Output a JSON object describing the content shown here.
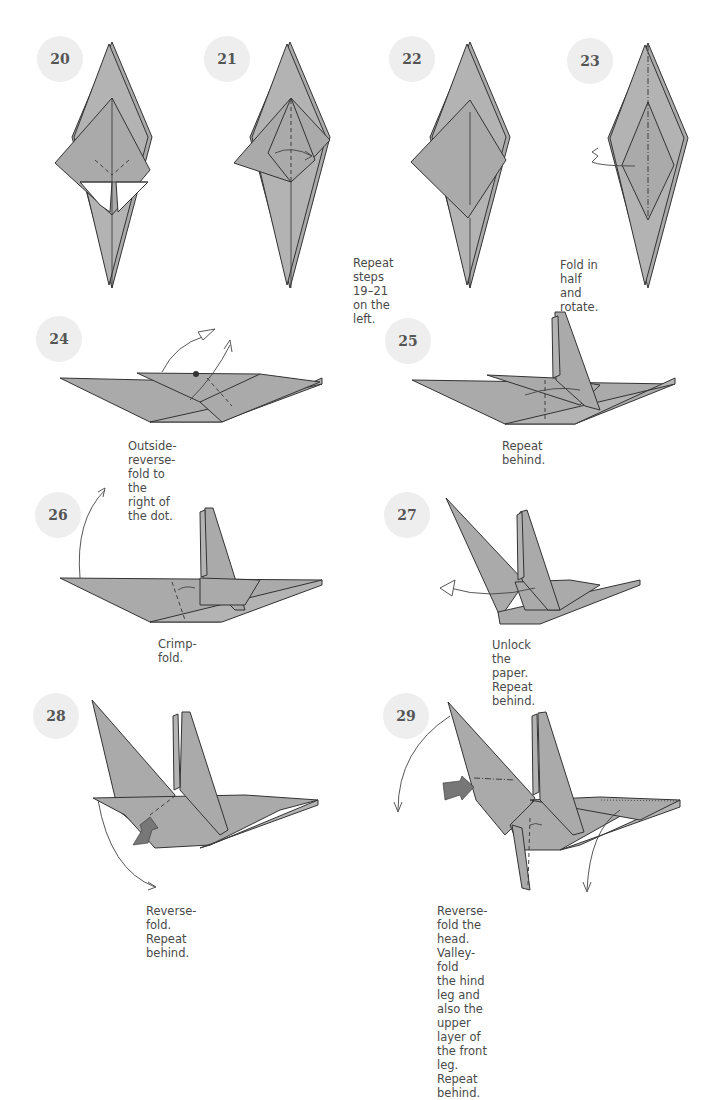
{
  "page": {
    "background": "#ffffff",
    "badge_color": "#eeeeee",
    "paper_color": "#aaaaaa"
  },
  "steps": [
    {
      "number": "20",
      "caption": ""
    },
    {
      "number": "21",
      "caption": ""
    },
    {
      "number": "22",
      "caption": "Repeat steps\n19–21 on the left."
    },
    {
      "number": "23",
      "caption": "Fold in half\nand rotate."
    },
    {
      "number": "24",
      "caption": "Outside-reverse-fold to\nthe right of the dot."
    },
    {
      "number": "25",
      "caption": "Repeat behind."
    },
    {
      "number": "26",
      "caption": "Crimp-fold."
    },
    {
      "number": "27",
      "caption": "Unlock the paper.\nRepeat behind."
    },
    {
      "number": "28",
      "caption": "Reverse-fold.\nRepeat behind."
    },
    {
      "number": "29",
      "caption": "Reverse-fold the head. Valley-fold\nthe hind leg and also the upper\nlayer of the front leg. Repeat behind."
    }
  ],
  "icons": {
    "valley_fold": "dashed-line",
    "mountain_fold": "dash-dot-line",
    "push_arrow": "gradient-push-arrow",
    "move_arrow": "curved-arrow",
    "reference_dot": "filled-dot"
  }
}
